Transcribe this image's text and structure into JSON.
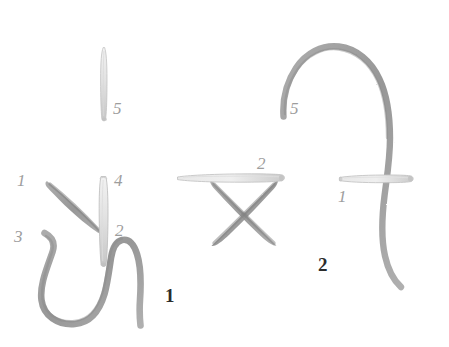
{
  "page": {
    "background_color": "#ffffff",
    "width": 449,
    "height": 347,
    "medium": "pencil-sketch"
  },
  "palette": {
    "thread_gray": "#9a9a9a",
    "thread_gray_dark": "#8b8b8b",
    "needle_gray": "#cfcfcf",
    "needle_outline": "#bdbdbd",
    "label_gray": "#9d9d9d",
    "fignum_black": "#2b2b2b"
  },
  "diagram": {
    "title_visible": false,
    "figures": [
      {
        "id": "figure-1",
        "number_label": "1",
        "number_pos": {
          "x": 165,
          "y": 286
        },
        "point_labels": [
          {
            "text": "1",
            "x": 17,
            "y": 172
          },
          {
            "text": "3",
            "x": 14,
            "y": 228
          },
          {
            "text": "4",
            "x": 114,
            "y": 172
          },
          {
            "text": "2",
            "x": 115,
            "y": 222
          }
        ]
      },
      {
        "id": "figure-2",
        "number_label": "2",
        "number_pos": {
          "x": 318,
          "y": 255
        },
        "point_labels": [
          {
            "text": "2",
            "x": 257,
            "y": 155
          },
          {
            "text": "5",
            "x": 290,
            "y": 100
          },
          {
            "text": "1",
            "x": 338,
            "y": 188
          }
        ]
      }
    ],
    "standalone_labels": [
      {
        "text": "5",
        "x": 113,
        "y": 100,
        "belongs_to": "top-needle"
      }
    ]
  },
  "elements": {
    "top_needle": {
      "name": "vertical-needle-top",
      "orientation": "vertical"
    },
    "fig1_diagonal_stitch": {
      "name": "diagonal-stitch-stroke"
    },
    "fig1_needle": {
      "name": "vertical-needle-figure-1",
      "orientation": "vertical"
    },
    "fig1_thread_loop": {
      "name": "thread-loop-figure-1"
    },
    "fig2_cross_stitch": {
      "name": "cross-stitch-x"
    },
    "fig2_needle_horizontal_top": {
      "name": "horizontal-needle-over-cross",
      "orientation": "horizontal"
    },
    "fig2_needle_horizontal_right": {
      "name": "horizontal-needle-figure-2",
      "orientation": "horizontal"
    },
    "fig2_thread_arc": {
      "name": "thread-arc-figure-2"
    }
  }
}
